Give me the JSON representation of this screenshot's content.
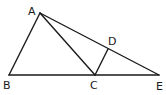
{
  "diagram": {
    "type": "geometry-figure",
    "points": {
      "A": {
        "label": "A",
        "x": 40,
        "y": 13
      },
      "B": {
        "label": "B",
        "x": 9,
        "y": 75
      },
      "C": {
        "label": "C",
        "x": 95,
        "y": 75
      },
      "D": {
        "label": "D",
        "x": 108,
        "y": 49
      },
      "E": {
        "label": "E",
        "x": 159,
        "y": 75
      }
    },
    "segments": [
      "AB",
      "AC",
      "AE",
      "BE",
      "CD"
    ],
    "line_color": "#1a1a1a",
    "background": "#ffffff"
  }
}
